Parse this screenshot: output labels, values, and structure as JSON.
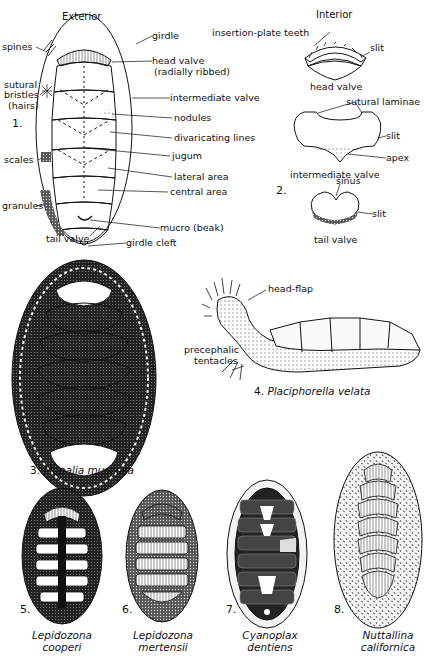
{
  "figure1": {
    "number": "1.",
    "title": "Exterior",
    "labels": {
      "spines": "spines",
      "girdle": "girdle",
      "head_valve": "head valve",
      "head_valve_note": "(radially ribbed)",
      "sutural": "sutural",
      "bristles": "bristles",
      "hairs": "(hairs)",
      "intermediate_valve": "intermediate valve",
      "nodules": "nodules",
      "divaricating_lines": "divaricating lines",
      "jugum": "jugum",
      "scales": "scales",
      "lateral_area": "lateral area",
      "central_area": "central area",
      "granules": "granules",
      "mucro": "mucro (beak)",
      "tail_valve": "tail valve",
      "girdle_cleft": "girdle cleft"
    }
  },
  "figure2": {
    "number": "2.",
    "title": "Interior",
    "labels": {
      "insertion_plate_teeth": "insertion-plate teeth",
      "slit_head": "slit",
      "head_valve": "head valve",
      "sutural_laminae": "sutural laminae",
      "slit_intermediate": "slit",
      "apex": "apex",
      "intermediate_valve": "intermediate valve",
      "sinus": "sinus",
      "slit_tail": "slit",
      "tail_valve": "tail valve"
    }
  },
  "figure3": {
    "number": "3.",
    "species": "Mopalia muscosa"
  },
  "figure4": {
    "number": "4.",
    "species": "Placiphorella velata",
    "labels": {
      "head_flap": "head-flap",
      "precephalic": "precephalic",
      "tentacles": "tentacles"
    }
  },
  "figure5": {
    "number": "5.",
    "genus": "Lepidozona",
    "epithet": "cooperi"
  },
  "figure6": {
    "number": "6.",
    "genus": "Lepidozona",
    "epithet": "mertensii"
  },
  "figure7": {
    "number": "7.",
    "genus": "Cyanoplax",
    "epithet": "dentiens"
  },
  "figure8": {
    "number": "8.",
    "genus": "Nuttallina",
    "epithet": "californica"
  }
}
